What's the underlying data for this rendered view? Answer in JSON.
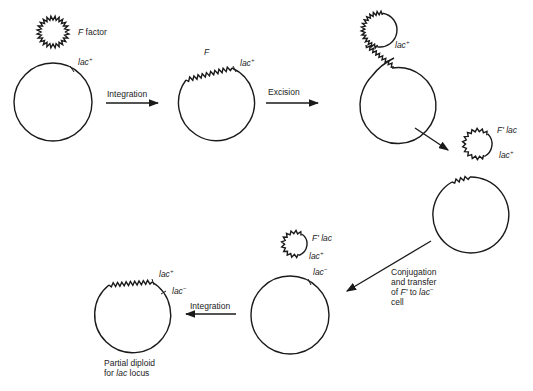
{
  "diagram": {
    "labels": {
      "f_factor": {
        "symbol": "F",
        "text": " factor"
      },
      "lac_plus_1": {
        "gene": "lac",
        "sup": "+"
      },
      "integration_1": "Integration",
      "f_integrated": "F",
      "lac_plus_2": {
        "gene": "lac",
        "sup": "+"
      },
      "excision": "Excision",
      "lac_plus_3": {
        "gene": "lac",
        "sup": "+"
      },
      "f_prime_lac_1": {
        "symbol": "F'",
        "gene": " lac"
      },
      "lac_plus_4": {
        "gene": "lac",
        "sup": "+"
      },
      "f_prime_lac_2": {
        "symbol": "F'",
        "gene": " lac"
      },
      "lac_plus_5": {
        "gene": "lac",
        "sup": "+"
      },
      "lac_minus_1": {
        "gene": "lac",
        "sup": "−"
      },
      "conjugation": {
        "line1": "Conjugation",
        "line2": "and transfer",
        "line3_pre": "of ",
        "line3_sym": "F'",
        "line3_mid": " to ",
        "line3_gene": "lac",
        "line3_sup": "−",
        "line4": "cell"
      },
      "integration_2": "Integration",
      "lac_plus_6": {
        "gene": "lac",
        "sup": "+"
      },
      "lac_minus_2": {
        "gene": "lac",
        "sup": "−"
      },
      "partial_diploid": {
        "line1": "Partial diploid",
        "line2_pre": "for ",
        "line2_gene": "lac",
        "line2_post": " locus"
      }
    },
    "colors": {
      "line": "#1a1a1a",
      "text": "#222222",
      "background": "#ffffff"
    }
  }
}
